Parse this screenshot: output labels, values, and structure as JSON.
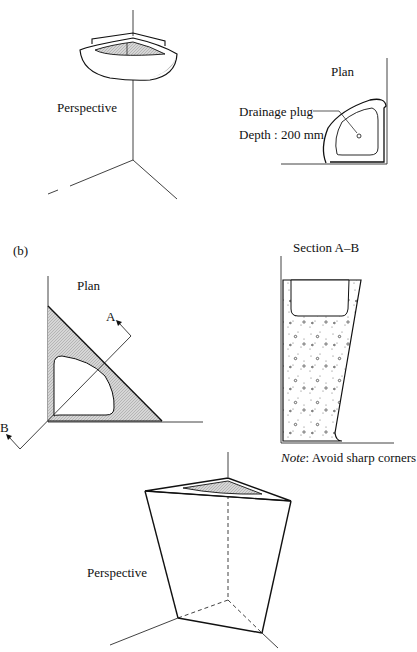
{
  "figure": {
    "part_b_marker": "(b)"
  },
  "top_perspective": {
    "label": "Perspective"
  },
  "top_plan": {
    "label": "Plan",
    "callout_plug": "Drainage plug",
    "callout_depth": "Depth : 200 mm"
  },
  "bottom_plan": {
    "label": "Plan",
    "section_mark_a": "A",
    "section_mark_b": "B"
  },
  "section": {
    "title": "Section A–B",
    "note_prefix": "Note",
    "note_text": ": Avoid sharp corners"
  },
  "bottom_perspective": {
    "label": "Perspective"
  },
  "colors": {
    "line": "#111111",
    "hatch_fill": "#c8c8c8",
    "background": "#ffffff"
  }
}
